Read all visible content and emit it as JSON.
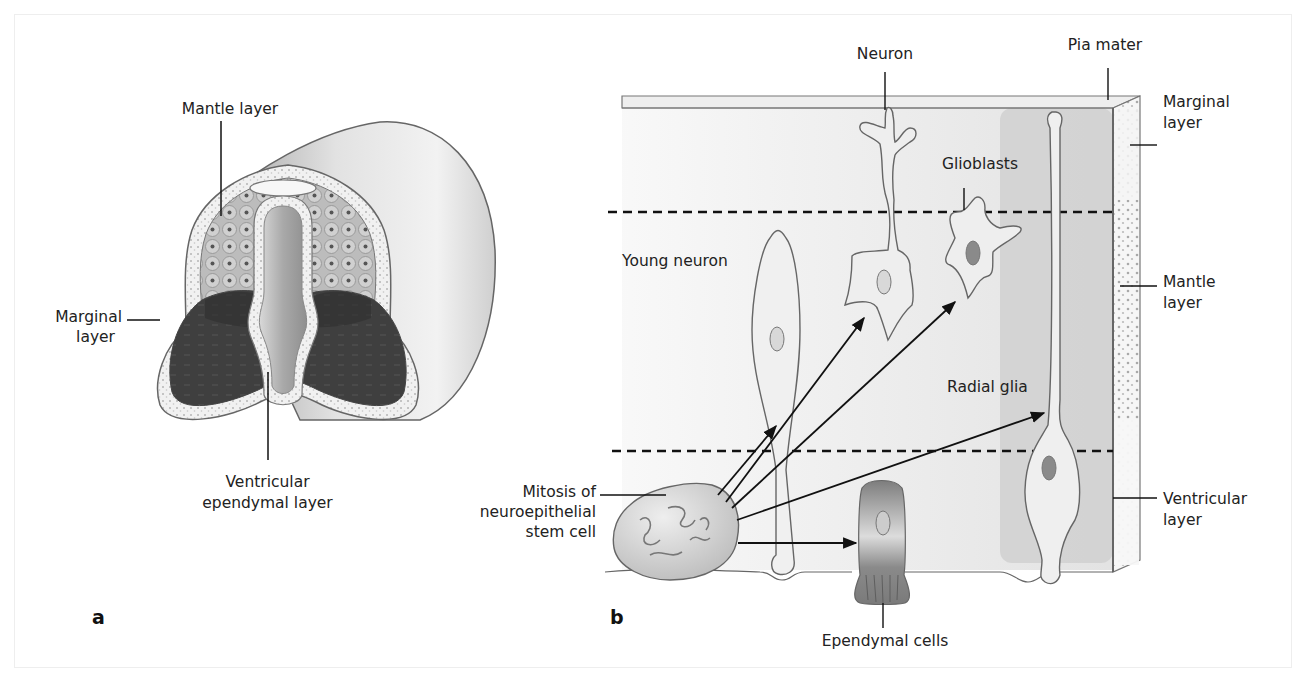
{
  "figure": {
    "panels": [
      {
        "id": "a",
        "letter": "a",
        "title": "Neural tube cross-section",
        "labels": {
          "mantle": "Mantle layer",
          "marginal_1": "Marginal",
          "marginal_2": "layer",
          "ventricular_1": "Ventricular",
          "ventricular_2": "ependymal layer"
        }
      },
      {
        "id": "b",
        "letter": "b",
        "title": "Histogenesis of neuroepithelium",
        "labels": {
          "neuron": "Neuron",
          "pia_mater": "Pia mater",
          "glioblasts": "Glioblasts",
          "young_neuron": "Young neuron",
          "radial_glia": "Radial glia",
          "mitosis_1": "Mitosis of",
          "mitosis_2": "neuroepithelial",
          "mitosis_3": "stem cell",
          "ependymal_cells": "Ependymal cells",
          "marginal_1": "Marginal",
          "marginal_2": "layer",
          "mantle_1": "Mantle",
          "mantle_2": "layer",
          "ventricular_1": "Ventricular",
          "ventricular_2": "layer"
        }
      }
    ],
    "colors": {
      "tissue_light": "#e6e6e6",
      "tissue_mid": "#c8c8c8",
      "marginal_dark": "#3c3c3c",
      "cell_fill": "#ececec",
      "nucleus_dark": "#8a8a8a",
      "outline": "#555555",
      "text": "#222222"
    }
  }
}
